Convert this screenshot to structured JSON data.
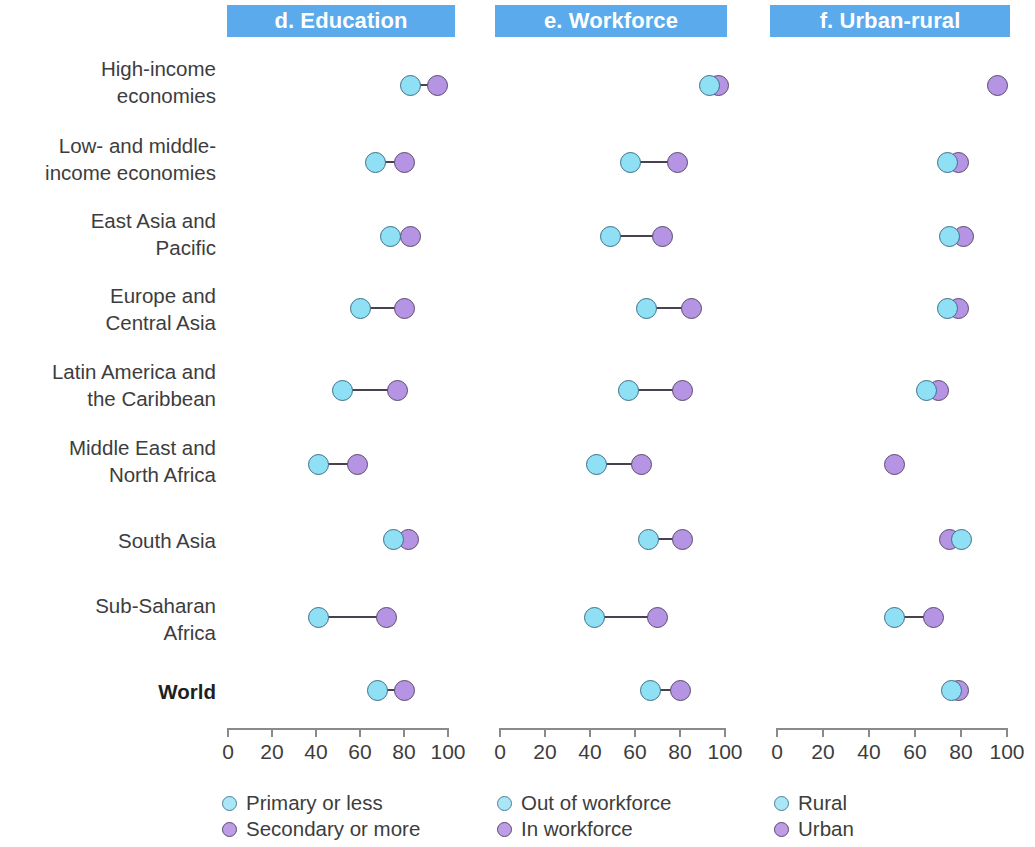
{
  "colors": {
    "header_bar": "#5aaaec",
    "header_text": "#ffffff",
    "series_blue": "#8fe0f5",
    "series_purple": "#b494e3",
    "connector": "#4a4150",
    "axis": "#8a8a8a",
    "label_text": "#3d3d3d"
  },
  "categories": [
    "High-income\neconomies",
    "Low- and middle-\nincome economies",
    "East Asia and\nPacific",
    "Europe and\nCentral Asia",
    "Latin America and\nthe Caribbean",
    "Middle East and\nNorth Africa",
    "South Asia",
    "Sub-Saharan\nAfrica",
    "World"
  ],
  "axis": {
    "min": 0,
    "max": 100,
    "ticks": [
      0,
      20,
      40,
      60,
      80,
      100
    ],
    "tick_labels": [
      "0",
      "20",
      "40",
      "60",
      "80",
      "100"
    ]
  },
  "panels": [
    {
      "id": "d",
      "title": "d. Education",
      "legend": [
        {
          "label": "Primary or less",
          "color": "blue"
        },
        {
          "label": "Secondary or more",
          "color": "purple"
        }
      ]
    },
    {
      "id": "e",
      "title": "e. Workforce",
      "legend": [
        {
          "label": "Out of workforce",
          "color": "blue"
        },
        {
          "label": "In workforce",
          "color": "purple"
        }
      ]
    },
    {
      "id": "f",
      "title": "f. Urban-rural",
      "legend": [
        {
          "label": "Rural",
          "color": "blue"
        },
        {
          "label": "Urban",
          "color": "purple"
        }
      ]
    }
  ],
  "chart_data": {
    "type": "scatter",
    "title": "",
    "subtitle": "",
    "xlabel": "",
    "ylabel": "",
    "xlim": [
      0,
      100
    ],
    "grid": false,
    "legend_position": "bottom",
    "panel_layout": "three side-by-side dumbbell (connected-dot) panels sharing one category axis",
    "categories": [
      "High-income economies",
      "Low- and middle-income economies",
      "East Asia and Pacific",
      "Europe and Central Asia",
      "Latin America and the Caribbean",
      "Middle East and North Africa",
      "South Asia",
      "Sub-Saharan Africa",
      "World"
    ],
    "panels": [
      {
        "id": "d",
        "title": "d. Education",
        "series": [
          {
            "name": "Primary or less",
            "color": "blue",
            "values": [
              83,
              67,
              74,
              60,
              52,
              41,
              75,
              41,
              68
            ]
          },
          {
            "name": "Secondary or more",
            "color": "purple",
            "values": [
              95,
              80,
              83,
              80,
              77,
              59,
              82,
              72,
              80
            ]
          }
        ]
      },
      {
        "id": "e",
        "title": "e. Workforce",
        "series": [
          {
            "name": "Out of workforce",
            "color": "blue",
            "values": [
              93,
              58,
              49,
              65,
              57,
              43,
              66,
              42,
              67
            ]
          },
          {
            "name": "In workforce",
            "color": "purple",
            "values": [
              97,
              79,
              72,
              85,
              81,
              63,
              81,
              70,
              80
            ]
          }
        ]
      },
      {
        "id": "f",
        "title": "f. Urban-rural",
        "series": [
          {
            "name": "Rural",
            "color": "blue",
            "values": [
              null,
              74,
              75,
              74,
              65,
              null,
              80,
              51,
              76
            ]
          },
          {
            "name": "Urban",
            "color": "purple",
            "values": [
              96,
              79,
              81,
              79,
              70,
              51,
              75,
              68,
              79
            ]
          }
        ]
      }
    ]
  }
}
